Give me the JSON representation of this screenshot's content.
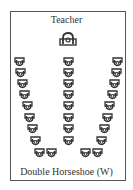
{
  "teacher_label": "Teacher",
  "caption": "Double Horseshoe (W)",
  "colors": {
    "stroke": "#333333",
    "frame": "#555555"
  },
  "icons": {
    "student_desk": "student-desk-icon",
    "teacher_desk": "teacher-desk-icon"
  },
  "desks": [
    [
      14,
      57
    ],
    [
      63,
      57
    ],
    [
      112,
      57
    ],
    [
      15,
      68
    ],
    [
      63,
      68
    ],
    [
      111,
      68
    ],
    [
      17,
      79
    ],
    [
      63,
      79
    ],
    [
      109,
      79
    ],
    [
      19,
      90
    ],
    [
      63,
      90
    ],
    [
      107,
      90
    ],
    [
      22,
      101
    ],
    [
      63,
      101
    ],
    [
      104,
      101
    ],
    [
      24,
      113
    ],
    [
      63,
      113
    ],
    [
      102,
      113
    ],
    [
      27,
      124
    ],
    [
      63,
      124
    ],
    [
      99,
      124
    ],
    [
      30,
      136
    ],
    [
      63,
      136
    ],
    [
      96,
      136
    ],
    [
      34,
      148
    ],
    [
      46,
      148
    ],
    [
      80,
      148
    ],
    [
      92,
      148
    ]
  ]
}
